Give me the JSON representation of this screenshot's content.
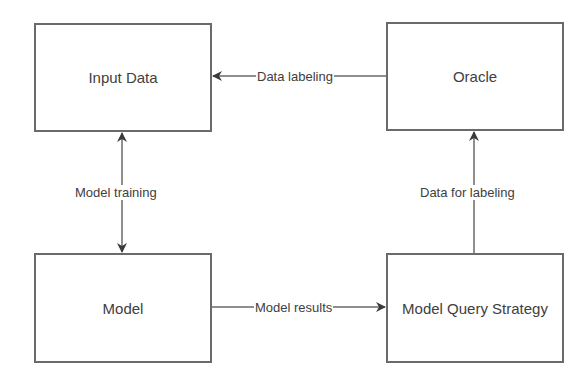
{
  "diagram": {
    "nodes": [
      {
        "id": "input-data",
        "label": "Input Data"
      },
      {
        "id": "oracle",
        "label": "Oracle"
      },
      {
        "id": "model",
        "label": "Model"
      },
      {
        "id": "model-query-strategy",
        "label": "Model Query Strategy"
      }
    ],
    "edges": [
      {
        "from": "oracle",
        "to": "input-data",
        "label": "Data labeling"
      },
      {
        "from": "input-data",
        "to": "model",
        "label": "Model training",
        "bidirectional": true
      },
      {
        "from": "model",
        "to": "model-query-strategy",
        "label": "Model results"
      },
      {
        "from": "model-query-strategy",
        "to": "oracle",
        "label": "Data for labeling"
      }
    ],
    "colors": {
      "line": "#6a6a6a",
      "arrow": "#3a3a3a",
      "text": "#404040"
    }
  }
}
